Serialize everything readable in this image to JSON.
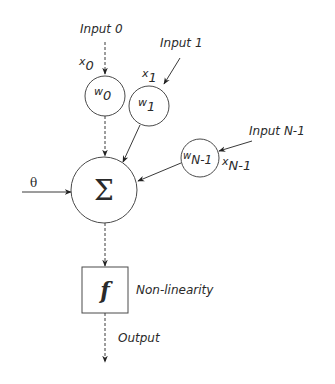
{
  "diagram": {
    "inputs": [
      {
        "label": "Input 0",
        "x_var": "x",
        "x_sub": "0",
        "weight_var": "w",
        "weight_sub": "0"
      },
      {
        "label": "Input 1",
        "x_var": "x",
        "x_sub": "1",
        "weight_var": "w",
        "weight_sub": "1"
      },
      {
        "label": "Input N-1",
        "x_var": "x",
        "x_sub": "N-1",
        "weight_var": "w",
        "weight_sub": "N-1"
      }
    ],
    "threshold": {
      "symbol": "θ"
    },
    "summation": {
      "symbol": "Σ"
    },
    "nonlinearity": {
      "symbol": "f",
      "label": "Non-linearity"
    },
    "output": {
      "label": "Output"
    },
    "colors": {
      "line": "#3a3a3a",
      "text": "#2a2a2a",
      "background": "#ffffff"
    }
  }
}
